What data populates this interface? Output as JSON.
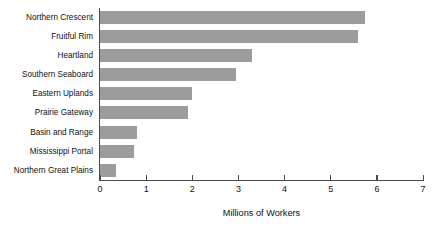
{
  "chart_data": {
    "type": "bar",
    "orientation": "horizontal",
    "title": "",
    "xlabel": "Millions of Workers",
    "ylabel": "",
    "xlim": [
      0,
      7
    ],
    "xticks": [
      0,
      1,
      2,
      3,
      4,
      5,
      6,
      7
    ],
    "xtick_labels": [
      "0",
      "1",
      "2",
      "3",
      "4",
      "5",
      "6",
      "7"
    ],
    "grid": false,
    "legend": false,
    "bar_color": "#9c9c9c",
    "axis_color": "#4a4a4a",
    "text_color": "#111111",
    "categories": [
      "Northern Crescent",
      "Fruitful Rim",
      "Heartland",
      "Southern Seaboard",
      "Eastern Uplands",
      "Prairie Gateway",
      "Basin and Range",
      "Mississippi Portal",
      "Northern Great Plains"
    ],
    "values": [
      5.75,
      5.58,
      3.3,
      2.95,
      2.0,
      1.91,
      0.8,
      0.74,
      0.35
    ]
  }
}
